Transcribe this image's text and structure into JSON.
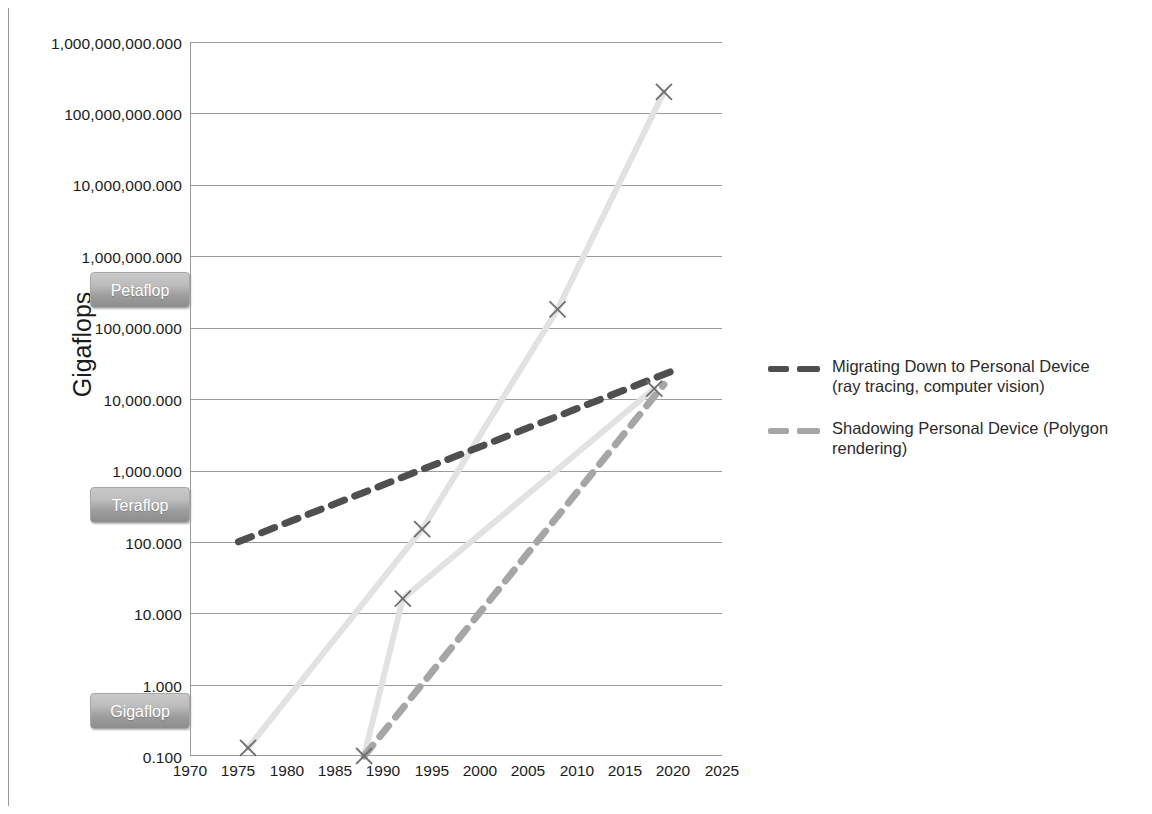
{
  "chart_data": {
    "type": "line",
    "title": "",
    "xlabel": "",
    "ylabel": "Gigaflops",
    "xlim": [
      1970,
      2025
    ],
    "ylim": [
      0.1,
      1000000000.0
    ],
    "yscale": "log",
    "grid": true,
    "legend_position": "right",
    "x_ticks": [
      "1970",
      "1975",
      "1980",
      "1985",
      "1990",
      "1995",
      "2000",
      "2005",
      "2010",
      "2015",
      "2020",
      "2025"
    ],
    "y_ticks": [
      "1,000,000,000.000",
      "100,000,000.000",
      "10,000,000.000",
      "1,000,000.000",
      "100,000.000",
      "10,000.000",
      "1,000.000",
      "100.000",
      "10.000",
      "1.000",
      "0.100"
    ],
    "y_axis_annotations": [
      {
        "label": "Petaflop",
        "value": 1000000000.0
      },
      {
        "label": "Teraflop",
        "value": 1000000.0
      },
      {
        "label": "Gigaflop",
        "value": 1000.0
      }
    ],
    "series": [
      {
        "name": "Migrating Down to Personal Device (ray tracing, computer vision)",
        "legend_label": "Migrating Down to Personal Device\n(ray tracing, computer vision)",
        "style": "dashed",
        "color": "#4f4f4f",
        "x": [
          1975,
          2020
        ],
        "values": [
          100.0,
          25000.0
        ]
      },
      {
        "name": "Shadowing Personal Device (Polygon rendering)",
        "legend_label": "Shadowing Personal Device (Polygon\nrendering)",
        "style": "dashed",
        "color": "#a6a6a6",
        "x": [
          1988,
          2019
        ],
        "values": [
          0.1,
          16000.0
        ]
      },
      {
        "name": "Supercomputer",
        "legend_label": "",
        "style": "solid",
        "color": "#e2e2e2",
        "x": [
          1976,
          1994,
          2008,
          2019
        ],
        "values": [
          0.13,
          150.0,
          180000.0,
          200000000.0
        ]
      },
      {
        "name": "Personal Device",
        "legend_label": "",
        "style": "solid",
        "color": "#e2e2e2",
        "x": [
          1988,
          1992,
          2018
        ],
        "values": [
          0.1,
          16.0,
          14000.0
        ]
      }
    ],
    "markers": [
      {
        "x": 1976,
        "y": 0.13
      },
      {
        "x": 1988,
        "y": 0.1
      },
      {
        "x": 1992,
        "y": 16.0
      },
      {
        "x": 1994,
        "y": 150.0
      },
      {
        "x": 2008,
        "y": 180000.0
      },
      {
        "x": 2018,
        "y": 14000.0
      },
      {
        "x": 2019,
        "y": 200000000.0
      }
    ]
  },
  "axis": {
    "y_title": "Gigaflops"
  },
  "legend": {
    "items": [
      {
        "line1": "Migrating Down to Personal Device",
        "line2": "(ray tracing, computer vision)",
        "color": "#4f4f4f"
      },
      {
        "line1": "Shadowing Personal Device (Polygon",
        "line2": "rendering)",
        "color": "#a6a6a6"
      }
    ]
  },
  "badges": [
    {
      "label": "Petaflop"
    },
    {
      "label": "Teraflop"
    },
    {
      "label": "Gigaflop"
    }
  ],
  "colors": {
    "grid": "#9b9b9b",
    "dark_series": "#4f4f4f",
    "mid_series": "#a6a6a6",
    "light_series": "#e2e2e2",
    "marker": "#6f6f6f",
    "text": "#1c1c1c"
  }
}
